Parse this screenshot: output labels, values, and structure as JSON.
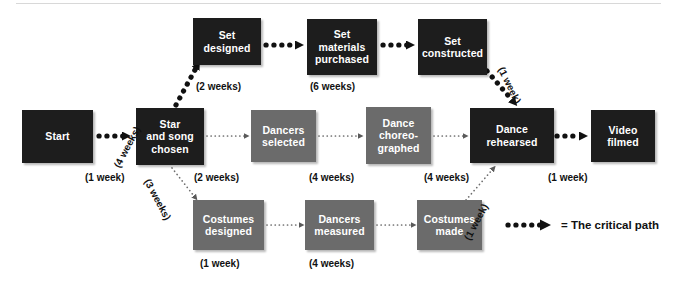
{
  "diagram": {
    "colors": {
      "critical_node": "#1d1d1d",
      "normal_node": "#6b6b6b",
      "node_text": "#ffffff",
      "label_text": "#111111",
      "background": "#ffffff",
      "rule": "#d8d8d8"
    },
    "nodes": [
      {
        "id": "start",
        "label": "Start",
        "type": "critical"
      },
      {
        "id": "set-designed",
        "label": "Set\ndesigned",
        "type": "critical"
      },
      {
        "id": "set-materials",
        "label": "Set\nmaterials\npurchased",
        "type": "critical"
      },
      {
        "id": "set-constructed",
        "label": "Set\nconstructed",
        "type": "critical"
      },
      {
        "id": "star-and-song",
        "label": "Star\nand song\nchosen",
        "type": "critical"
      },
      {
        "id": "dancers-selected",
        "label": "Dancers\nselected",
        "type": "normal"
      },
      {
        "id": "dance-choreographed",
        "label": "Dance\nchoreo-\ngraphed",
        "type": "normal"
      },
      {
        "id": "dance-rehearsed",
        "label": "Dance\nrehearsed",
        "type": "critical"
      },
      {
        "id": "video-filmed",
        "label": "Video\nfilmed",
        "type": "critical"
      },
      {
        "id": "costumes-designed",
        "label": "Costumes\ndesigned",
        "type": "normal"
      },
      {
        "id": "dancers-measured",
        "label": "Dancers\nmeasured",
        "type": "normal"
      },
      {
        "id": "costumes-made",
        "label": "Costumes\nmade",
        "type": "normal"
      }
    ],
    "durations": [
      {
        "id": "start-to-star",
        "label": "(1 week)",
        "critical": true,
        "rotated": false
      },
      {
        "id": "star-to-set-designed",
        "label": "(4 weeks)",
        "critical": true,
        "rotated": true
      },
      {
        "id": "set-designed-to-materials",
        "label": "(2 weeks)",
        "critical": true,
        "rotated": false
      },
      {
        "id": "materials-to-constructed",
        "label": "(6 weeks)",
        "critical": true,
        "rotated": false
      },
      {
        "id": "constructed-to-rehearsed",
        "label": "(1 week)",
        "critical": true,
        "rotated": true
      },
      {
        "id": "star-to-dancers-selected",
        "label": "(2 weeks)",
        "critical": false,
        "rotated": false
      },
      {
        "id": "dancers-selected-to-choreo",
        "label": "(4 weeks)",
        "critical": false,
        "rotated": false
      },
      {
        "id": "choreo-to-rehearsed",
        "label": "(4 weeks)",
        "critical": false,
        "rotated": false
      },
      {
        "id": "rehearsed-to-filmed",
        "label": "(1 week)",
        "critical": true,
        "rotated": false
      },
      {
        "id": "star-to-costumes-designed",
        "label": "(3 weeks)",
        "critical": false,
        "rotated": true
      },
      {
        "id": "costumes-designed-to-measured",
        "label": "(1 week)",
        "critical": false,
        "rotated": false
      },
      {
        "id": "measured-to-costumes-made",
        "label": "(4 weeks)",
        "critical": false,
        "rotated": false
      },
      {
        "id": "costumes-made-to-rehearsed",
        "label": "(1 week)",
        "critical": false,
        "rotated": true
      }
    ],
    "legend": {
      "text": "= The critical path"
    }
  }
}
